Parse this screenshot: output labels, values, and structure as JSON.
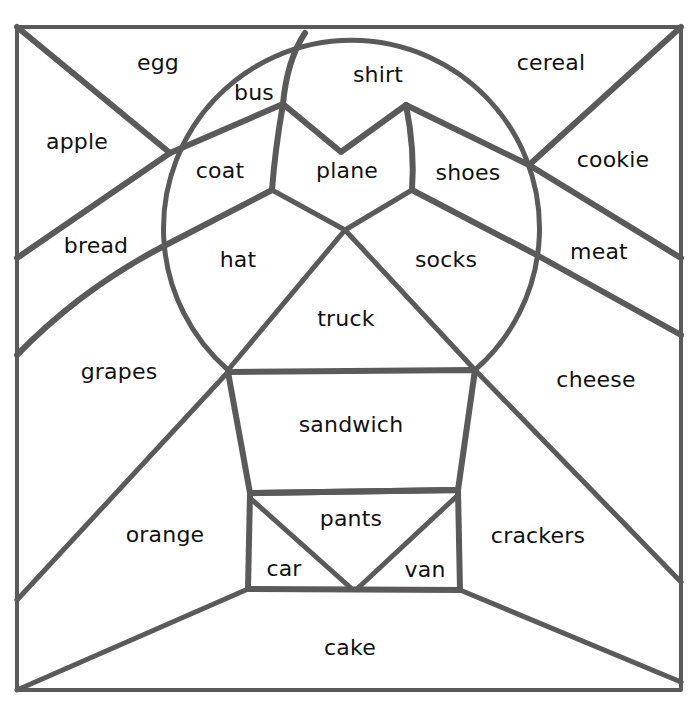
{
  "worksheet": {
    "type": "color-by-word puzzle",
    "regions": [
      {
        "id": "egg",
        "label": "egg",
        "x": 158,
        "y": 62
      },
      {
        "id": "bus",
        "label": "bus",
        "x": 254,
        "y": 92
      },
      {
        "id": "shirt",
        "label": "shirt",
        "x": 378,
        "y": 74
      },
      {
        "id": "cereal",
        "label": "cereal",
        "x": 551,
        "y": 62
      },
      {
        "id": "apple",
        "label": "apple",
        "x": 77,
        "y": 141
      },
      {
        "id": "coat",
        "label": "coat",
        "x": 220,
        "y": 170
      },
      {
        "id": "plane",
        "label": "plane",
        "x": 347,
        "y": 170
      },
      {
        "id": "shoes",
        "label": "shoes",
        "x": 468,
        "y": 172
      },
      {
        "id": "cookie",
        "label": "cookie",
        "x": 613,
        "y": 159
      },
      {
        "id": "bread",
        "label": "bread",
        "x": 96,
        "y": 245
      },
      {
        "id": "hat",
        "label": "hat",
        "x": 238,
        "y": 259
      },
      {
        "id": "socks",
        "label": "socks",
        "x": 446,
        "y": 259
      },
      {
        "id": "meat",
        "label": "meat",
        "x": 599,
        "y": 251
      },
      {
        "id": "truck",
        "label": "truck",
        "x": 346,
        "y": 318
      },
      {
        "id": "grapes",
        "label": "grapes",
        "x": 119,
        "y": 371
      },
      {
        "id": "cheese",
        "label": "cheese",
        "x": 596,
        "y": 379
      },
      {
        "id": "sandwich",
        "label": "sandwich",
        "x": 351,
        "y": 424
      },
      {
        "id": "pants",
        "label": "pants",
        "x": 351,
        "y": 518
      },
      {
        "id": "orange",
        "label": "orange",
        "x": 165,
        "y": 534
      },
      {
        "id": "crackers",
        "label": "crackers",
        "x": 538,
        "y": 535
      },
      {
        "id": "car",
        "label": "car",
        "x": 284,
        "y": 568
      },
      {
        "id": "van",
        "label": "van",
        "x": 425,
        "y": 569
      },
      {
        "id": "cake",
        "label": "cake",
        "x": 350,
        "y": 647
      }
    ]
  },
  "colors": {
    "line": "#5a5a5a",
    "background": "#ffffff",
    "text": "#111111"
  }
}
